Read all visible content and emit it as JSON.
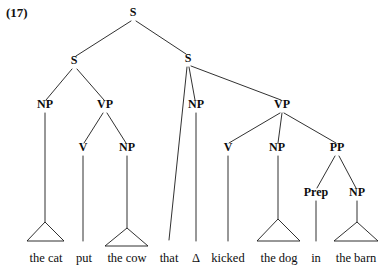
{
  "example": {
    "number_label": "(17)"
  },
  "diagram": {
    "type": "syntax-tree",
    "sentence": "the cat put the cow that Δ kicked the dog in the barn",
    "ink_color": "#1a1a1a",
    "text_color": "#0d0d0d",
    "background_color": "#ffffff",
    "nodes": [
      {
        "id": "S0",
        "label": "S",
        "x": 133,
        "y": 16,
        "kind": "phrase"
      },
      {
        "id": "S1",
        "label": "S",
        "x": 74,
        "y": 64,
        "kind": "phrase"
      },
      {
        "id": "S2",
        "label": "S",
        "x": 188,
        "y": 62,
        "kind": "phrase"
      },
      {
        "id": "NP1",
        "label": "NP",
        "x": 45,
        "y": 108,
        "kind": "phrase"
      },
      {
        "id": "VP1",
        "label": "VP",
        "x": 105,
        "y": 108,
        "kind": "phrase"
      },
      {
        "id": "V1",
        "label": "V",
        "x": 83,
        "y": 151,
        "kind": "lexical"
      },
      {
        "id": "NP2",
        "label": "NP",
        "x": 127,
        "y": 151,
        "kind": "phrase"
      },
      {
        "id": "NP3",
        "label": "NP",
        "x": 196,
        "y": 108,
        "kind": "phrase"
      },
      {
        "id": "VP2",
        "label": "VP",
        "x": 282,
        "y": 108,
        "kind": "phrase"
      },
      {
        "id": "V2",
        "label": "V",
        "x": 228,
        "y": 151,
        "kind": "lexical"
      },
      {
        "id": "NP4",
        "label": "NP",
        "x": 277,
        "y": 151,
        "kind": "phrase"
      },
      {
        "id": "PP1",
        "label": "PP",
        "x": 337,
        "y": 151,
        "kind": "phrase"
      },
      {
        "id": "Prep1",
        "label": "Prep",
        "x": 316,
        "y": 196,
        "kind": "lexical"
      },
      {
        "id": "NP5",
        "label": "NP",
        "x": 357,
        "y": 196,
        "kind": "phrase"
      }
    ],
    "edges": [
      {
        "from": "S0",
        "to": "S1",
        "x1": 131,
        "y1": 21,
        "x2": 76,
        "y2": 56
      },
      {
        "from": "S0",
        "to": "S2",
        "x1": 136,
        "y1": 21,
        "x2": 186,
        "y2": 54
      },
      {
        "from": "S1",
        "to": "NP1",
        "x1": 72,
        "y1": 69,
        "x2": 46,
        "y2": 100
      },
      {
        "from": "S1",
        "to": "VP1",
        "x1": 77,
        "y1": 69,
        "x2": 104,
        "y2": 100
      },
      {
        "from": "VP1",
        "to": "V1",
        "x1": 103,
        "y1": 113,
        "x2": 84,
        "y2": 143
      },
      {
        "from": "VP1",
        "to": "NP2",
        "x1": 107,
        "y1": 113,
        "x2": 126,
        "y2": 143
      },
      {
        "from": "S2",
        "to": "that",
        "x1": 187,
        "y1": 67,
        "x2": 169,
        "y2": 240
      },
      {
        "from": "S2",
        "to": "NP3",
        "x1": 189,
        "y1": 67,
        "x2": 195,
        "y2": 100
      },
      {
        "from": "S2",
        "to": "VP2",
        "x1": 191,
        "y1": 66,
        "x2": 281,
        "y2": 100
      },
      {
        "from": "VP2",
        "to": "V2",
        "x1": 280,
        "y1": 113,
        "x2": 229,
        "y2": 143
      },
      {
        "from": "VP2",
        "to": "NP4",
        "x1": 282,
        "y1": 113,
        "x2": 278,
        "y2": 143
      },
      {
        "from": "VP2",
        "to": "PP1",
        "x1": 284,
        "y1": 113,
        "x2": 336,
        "y2": 143
      },
      {
        "from": "PP1",
        "to": "Prep1",
        "x1": 335,
        "y1": 156,
        "x2": 317,
        "y2": 188
      },
      {
        "from": "PP1",
        "to": "NP5",
        "x1": 339,
        "y1": 156,
        "x2": 356,
        "y2": 188
      },
      {
        "from": "NP1",
        "to": "tri1",
        "x1": 45,
        "y1": 113,
        "x2": 45,
        "y2": 222
      },
      {
        "from": "V1",
        "to": "put",
        "x1": 83,
        "y1": 156,
        "x2": 83,
        "y2": 241
      },
      {
        "from": "NP2",
        "to": "tri2",
        "x1": 127,
        "y1": 156,
        "x2": 127,
        "y2": 228
      },
      {
        "from": "NP3",
        "to": "delta",
        "x1": 196,
        "y1": 113,
        "x2": 196,
        "y2": 241
      },
      {
        "from": "V2",
        "to": "kicked",
        "x1": 228,
        "y1": 156,
        "x2": 228,
        "y2": 241
      },
      {
        "from": "NP4",
        "to": "tri3",
        "x1": 278,
        "y1": 156,
        "x2": 278,
        "y2": 219
      },
      {
        "from": "Prep1",
        "to": "in",
        "x1": 316,
        "y1": 201,
        "x2": 316,
        "y2": 241
      },
      {
        "from": "NP5",
        "to": "tri4",
        "x1": 357,
        "y1": 201,
        "x2": 357,
        "y2": 222
      }
    ],
    "triangles": [
      {
        "id": "tri1",
        "for": "the cat",
        "apex_x": 45,
        "apex_y": 222,
        "left_x": 27,
        "right_x": 64,
        "base_y": 241
      },
      {
        "id": "tri2",
        "for": "the cow",
        "apex_x": 127,
        "apex_y": 228,
        "left_x": 105,
        "right_x": 148,
        "base_y": 246
      },
      {
        "id": "tri3",
        "for": "the dog",
        "apex_x": 278,
        "apex_y": 219,
        "left_x": 257,
        "right_x": 300,
        "base_y": 241
      },
      {
        "id": "tri4",
        "for": "the barn",
        "apex_x": 357,
        "apex_y": 222,
        "left_x": 334,
        "right_x": 378,
        "base_y": 241
      }
    ],
    "leaves": [
      {
        "id": "leaf-the-cat",
        "text": "the cat",
        "x": 46,
        "y": 262,
        "parent": "NP1"
      },
      {
        "id": "leaf-put",
        "text": "put",
        "x": 84,
        "y": 262,
        "parent": "V1"
      },
      {
        "id": "leaf-the-cow",
        "text": "the cow",
        "x": 127,
        "y": 262,
        "parent": "NP2"
      },
      {
        "id": "leaf-that",
        "text": "that",
        "x": 169,
        "y": 262,
        "parent": "S2"
      },
      {
        "id": "leaf-delta",
        "text": "Δ",
        "x": 196,
        "y": 262,
        "parent": "NP3"
      },
      {
        "id": "leaf-kicked",
        "text": "kicked",
        "x": 228,
        "y": 262,
        "parent": "V2"
      },
      {
        "id": "leaf-the-dog",
        "text": "the dog",
        "x": 279,
        "y": 262,
        "parent": "NP4"
      },
      {
        "id": "leaf-in",
        "text": "in",
        "x": 316,
        "y": 262,
        "parent": "Prep1"
      },
      {
        "id": "leaf-the-barn",
        "text": "the barn",
        "x": 356,
        "y": 262,
        "parent": "NP5"
      }
    ]
  }
}
